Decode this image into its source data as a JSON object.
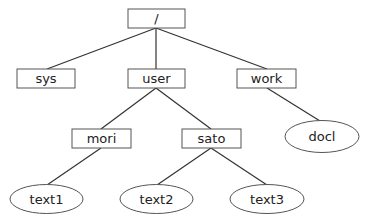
{
  "diagram": {
    "type": "directory-tree",
    "nodes": [
      {
        "id": "root",
        "label": "/",
        "shape": "rect"
      },
      {
        "id": "sys",
        "label": "sys",
        "shape": "rect"
      },
      {
        "id": "user",
        "label": "user",
        "shape": "rect"
      },
      {
        "id": "work",
        "label": "work",
        "shape": "rect"
      },
      {
        "id": "mori",
        "label": "mori",
        "shape": "rect"
      },
      {
        "id": "sato",
        "label": "sato",
        "shape": "rect"
      },
      {
        "id": "docl",
        "label": "docl",
        "shape": "ellipse"
      },
      {
        "id": "text1",
        "label": "text1",
        "shape": "ellipse"
      },
      {
        "id": "text2",
        "label": "text2",
        "shape": "ellipse"
      },
      {
        "id": "text3",
        "label": "text3",
        "shape": "ellipse"
      }
    ],
    "edges": [
      [
        "root",
        "sys"
      ],
      [
        "root",
        "user"
      ],
      [
        "root",
        "work"
      ],
      [
        "user",
        "mori"
      ],
      [
        "user",
        "sato"
      ],
      [
        "work",
        "docl"
      ],
      [
        "mori",
        "text1"
      ],
      [
        "sato",
        "text2"
      ],
      [
        "sato",
        "text3"
      ]
    ],
    "legend": {
      "rect": "directory",
      "ellipse": "file"
    }
  }
}
